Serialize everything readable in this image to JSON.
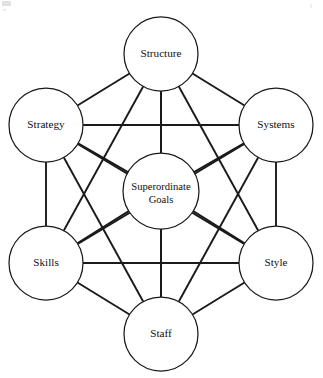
{
  "diagram": {
    "type": "network-diagram",
    "layout": "hexagon-with-center",
    "canvas": {
      "width": 323,
      "height": 378
    },
    "style": {
      "background_color": "#ffffff",
      "line_color": "#1a1a1a",
      "node_fill": "#ffffff",
      "node_stroke": "#1a1a1a",
      "text_color": "#111111"
    },
    "nodes": [
      {
        "id": "structure",
        "label": "Structure",
        "role": "outer",
        "position": "top",
        "cx": 161,
        "cy": 54,
        "r": 37
      },
      {
        "id": "strategy",
        "label": "Strategy",
        "role": "outer",
        "position": "upper-left",
        "cx": 46,
        "cy": 125,
        "r": 37
      },
      {
        "id": "systems",
        "label": "Systems",
        "role": "outer",
        "position": "upper-right",
        "cx": 276,
        "cy": 125,
        "r": 37
      },
      {
        "id": "skills",
        "label": "Skills",
        "role": "outer",
        "position": "lower-left",
        "cx": 46,
        "cy": 263,
        "r": 37
      },
      {
        "id": "style",
        "label": "Style",
        "role": "outer",
        "position": "lower-right",
        "cx": 276,
        "cy": 263,
        "r": 37
      },
      {
        "id": "staff",
        "label": "Staff",
        "role": "outer",
        "position": "bottom",
        "cx": 161,
        "cy": 334,
        "r": 37
      },
      {
        "id": "superordinate-goals",
        "label_line1": "Superordinate",
        "label_line2": "Goals",
        "role": "center",
        "position": "center",
        "cx": 161,
        "cy": 191,
        "r": 38
      }
    ],
    "edges": [
      {
        "from": "structure",
        "to": "strategy"
      },
      {
        "from": "structure",
        "to": "systems"
      },
      {
        "from": "structure",
        "to": "skills"
      },
      {
        "from": "structure",
        "to": "style"
      },
      {
        "from": "structure",
        "to": "staff"
      },
      {
        "from": "structure",
        "to": "superordinate-goals"
      },
      {
        "from": "strategy",
        "to": "systems"
      },
      {
        "from": "strategy",
        "to": "skills"
      },
      {
        "from": "strategy",
        "to": "style"
      },
      {
        "from": "strategy",
        "to": "staff"
      },
      {
        "from": "strategy",
        "to": "superordinate-goals"
      },
      {
        "from": "systems",
        "to": "skills"
      },
      {
        "from": "systems",
        "to": "style"
      },
      {
        "from": "systems",
        "to": "staff"
      },
      {
        "from": "systems",
        "to": "superordinate-goals"
      },
      {
        "from": "skills",
        "to": "style"
      },
      {
        "from": "skills",
        "to": "staff"
      },
      {
        "from": "skills",
        "to": "superordinate-goals"
      },
      {
        "from": "style",
        "to": "staff"
      },
      {
        "from": "style",
        "to": "superordinate-goals"
      },
      {
        "from": "staff",
        "to": "superordinate-goals"
      }
    ]
  }
}
